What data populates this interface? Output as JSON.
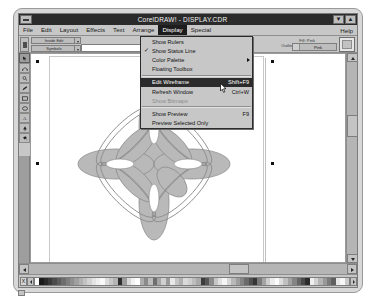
{
  "window": {
    "title": "CorelDRAW! - DISPLAY.CDR",
    "minimize_label": "▼",
    "maximize_label": "▲",
    "system_menu_name": "system-menu"
  },
  "menubar": {
    "items": [
      {
        "label": "File",
        "accel": "F"
      },
      {
        "label": "Edit",
        "accel": "E"
      },
      {
        "label": "Layout",
        "accel": "L"
      },
      {
        "label": "Effects",
        "accel": "f"
      },
      {
        "label": "Text",
        "accel": "T"
      },
      {
        "label": "Arrange",
        "accel": "A"
      },
      {
        "label": "Display",
        "accel": "D"
      },
      {
        "label": "Special",
        "accel": "S"
      }
    ],
    "active_index": 6,
    "help_label": "Help"
  },
  "display_menu": {
    "items": [
      {
        "label": "Show Rulers",
        "shortcut": "",
        "checked": false,
        "disabled": false,
        "highlighted": false,
        "submenu": false
      },
      {
        "label": "Show Status Line",
        "shortcut": "",
        "checked": true,
        "disabled": false,
        "highlighted": false,
        "submenu": false
      },
      {
        "label": "Color Palette",
        "shortcut": "",
        "checked": false,
        "disabled": false,
        "highlighted": false,
        "submenu": true
      },
      {
        "label": "Floating Toolbox",
        "shortcut": "",
        "checked": false,
        "disabled": false,
        "highlighted": false,
        "submenu": false
      },
      {
        "label": "Edit Wireframe",
        "shortcut": "Shift+F9",
        "checked": false,
        "disabled": false,
        "highlighted": true,
        "submenu": false
      },
      {
        "label": "Refresh Window",
        "shortcut": "Ctrl+W",
        "checked": false,
        "disabled": false,
        "highlighted": false,
        "submenu": false
      },
      {
        "label": "Show Bitmaps",
        "shortcut": "",
        "checked": false,
        "disabled": true,
        "highlighted": false,
        "submenu": false
      },
      {
        "label": "Show Preview",
        "shortcut": "F9",
        "checked": false,
        "disabled": false,
        "highlighted": false,
        "submenu": false
      },
      {
        "label": "Preview Selected Only",
        "shortcut": "",
        "checked": false,
        "disabled": false,
        "highlighted": false,
        "submenu": false
      }
    ],
    "separator_after": [
      3,
      6
    ]
  },
  "ribbon": {
    "combo_top_value": "Inside Edit",
    "combo_bottom_value": "Symbols",
    "fill_status": "Fill: Pink",
    "outline_status": "Outline: .32 points",
    "fill_button_label": "Pink"
  },
  "toolbox": {
    "tools": [
      {
        "name": "pick-tool",
        "selected": true
      },
      {
        "name": "shape-tool",
        "selected": false
      },
      {
        "name": "zoom-tool",
        "selected": false
      },
      {
        "name": "pencil-tool",
        "selected": false
      },
      {
        "name": "rectangle-tool",
        "selected": false
      },
      {
        "name": "ellipse-tool",
        "selected": false
      },
      {
        "name": "text-tool",
        "selected": false
      },
      {
        "name": "outline-pen-tool",
        "selected": false
      },
      {
        "name": "fill-tool",
        "selected": false
      }
    ]
  },
  "canvas": {
    "object_name": "flower-petal-drawing",
    "petal_fill": "#b8b8b8",
    "petal_stroke": "#7c7c7c",
    "handle_color": "#111111",
    "selection_handles": 8
  },
  "palette": {
    "no_fill_label": "X",
    "swatches": [
      "#ffffff",
      "#1b1b1b",
      "#2a2a2a",
      "#3a3a3a",
      "#4b4b4b",
      "#5c5c5c",
      "#6d6d6d",
      "#7e7e7e",
      "#8f8f8f",
      "#a0a0a0",
      "#b1b1b1",
      "#c2c2c2",
      "#d3d3d3",
      "#e4e4e4",
      "#f0f0f0",
      "#fafafa",
      "#dcdcdc",
      "#c8c8c8",
      "#b4b4b4",
      "#2e2e2e",
      "#9c9c9c",
      "#d8d8d8",
      "#f2f2f2",
      "#ffffff",
      "#adadad",
      "#8a8a8a",
      "#bcbcbc",
      "#6f6f6f",
      "#a6a6a6",
      "#d0d0d0",
      "#9a9a9a",
      "#e8e8e8",
      "#c4c4c4",
      "#b0b0b0",
      "#dadada",
      "#cfcfcf",
      "#bdbdbd",
      "#a9a9a9",
      "#3c3c3c",
      "#565656",
      "#8b8b8b",
      "#c6c6c6",
      "#e0e0e0",
      "#f5f5f5",
      "#d6d6d6",
      "#b8b8b8",
      "#9e9e9e",
      "#848484",
      "#6a6a6a",
      "#505050",
      "#363636",
      "#7a7a7a",
      "#a4a4a4",
      "#cecece",
      "#ececec",
      "#fbfbfb",
      "#dedede",
      "#c0c0c0",
      "#a2a2a2",
      "#848484",
      "#666666",
      "#484848",
      "#2a2a2a",
      "#efefef",
      "#d2d2d2",
      "#b5b5b5",
      "#989898",
      "#7b7b7b",
      "#5e5e5e",
      "#e6e6e6",
      "#f8f8f8",
      "#cacaca"
    ]
  },
  "scrollbars": {
    "vertical_up": "▲",
    "vertical_down": "▼",
    "horizontal_left": "◄",
    "horizontal_right": "►"
  }
}
